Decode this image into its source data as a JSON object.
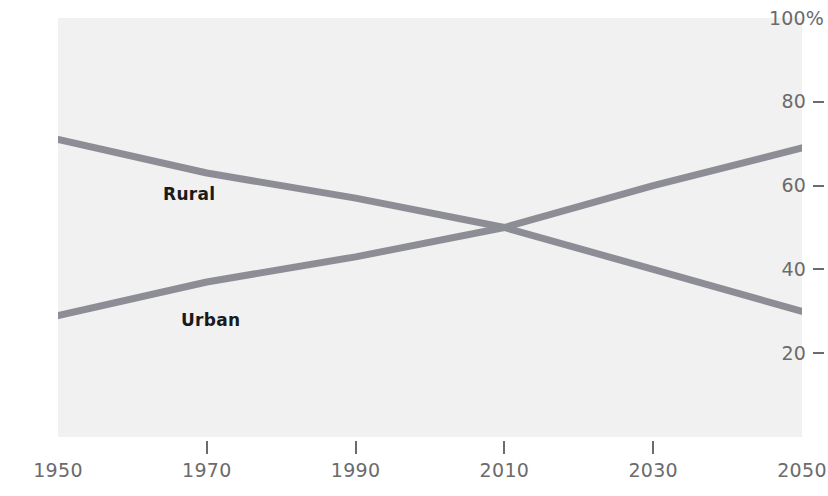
{
  "chart_data": {
    "type": "line",
    "title": "",
    "subtitle": "",
    "xlabel": "",
    "ylabel": "",
    "xlim": [
      1950,
      2050
    ],
    "ylim": [
      0,
      100
    ],
    "grid": false,
    "legend_position": "inline-annotation",
    "background_color": "#f1f1f1",
    "line_color": "#8d8d96",
    "x_tick_labels": [
      "1950",
      "1970",
      "1990",
      "2010",
      "2030",
      "2050"
    ],
    "x_ticks": [
      1950,
      1970,
      1990,
      2010,
      2030,
      2050
    ],
    "y_tick_labels": [
      "100%",
      "80",
      "60",
      "40",
      "20"
    ],
    "y_ticks": [
      100,
      80,
      60,
      40,
      20
    ],
    "x": [
      1950,
      1970,
      1990,
      2010,
      2030,
      2050
    ],
    "series": [
      {
        "name": "Rural",
        "label": "Rural",
        "color": "#8d8d96",
        "values": [
          71,
          63,
          57,
          50,
          40,
          30
        ]
      },
      {
        "name": "Urban",
        "label": "Urban",
        "color": "#8d8d96",
        "values": [
          29,
          37,
          43,
          50,
          60,
          69
        ]
      }
    ],
    "annotations": [
      {
        "text": "Rural",
        "x": 1965,
        "y": 59
      },
      {
        "text": "Urban",
        "x": 1968,
        "y": 33
      }
    ],
    "crossover": {
      "x": 2009,
      "y": 50
    }
  },
  "axes": {
    "y_labels": [
      "100%",
      "80",
      "60",
      "40",
      "20"
    ],
    "x_labels": [
      "1950",
      "1970",
      "1990",
      "2010",
      "2030",
      "2050"
    ]
  }
}
